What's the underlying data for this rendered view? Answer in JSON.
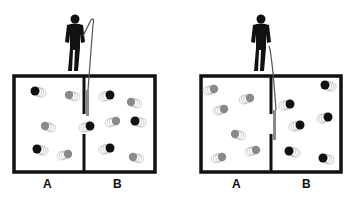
{
  "colors": {
    "fast_molecule": "#111111",
    "slow_molecule": "#8a8a8a",
    "wall": "#111111",
    "gate": "#8a8a8a"
  },
  "panels": [
    {
      "name": "before",
      "box": {
        "x": 14,
        "y": 76,
        "w": 141,
        "h": 96
      },
      "divider_x": 84,
      "gate_state": "raised",
      "figure_x": 75,
      "labels": {
        "left": "A",
        "right": "B"
      },
      "label_positions": {
        "left": 48,
        "right": 118
      },
      "molecules": [
        {
          "x": 35,
          "y": 91,
          "type": "fast"
        },
        {
          "x": 69,
          "y": 95,
          "type": "slow"
        },
        {
          "x": 110,
          "y": 95,
          "type": "fast"
        },
        {
          "x": 131,
          "y": 102,
          "type": "slow"
        },
        {
          "x": 45,
          "y": 126,
          "type": "slow"
        },
        {
          "x": 90,
          "y": 126,
          "type": "fast"
        },
        {
          "x": 116,
          "y": 121,
          "type": "slow"
        },
        {
          "x": 135,
          "y": 121,
          "type": "fast"
        },
        {
          "x": 37,
          "y": 149,
          "type": "fast"
        },
        {
          "x": 68,
          "y": 154,
          "type": "slow"
        },
        {
          "x": 110,
          "y": 148,
          "type": "fast"
        },
        {
          "x": 133,
          "y": 157,
          "type": "slow"
        }
      ]
    },
    {
      "name": "after",
      "box": {
        "x": 201,
        "y": 76,
        "w": 140,
        "h": 96
      },
      "divider_x": 271,
      "gate_state": "lowered",
      "figure_x": 261,
      "labels": {
        "left": "A",
        "right": "B"
      },
      "label_positions": {
        "left": 237,
        "right": 307
      },
      "molecules": [
        {
          "x": 214,
          "y": 89,
          "type": "slow"
        },
        {
          "x": 250,
          "y": 98,
          "type": "slow"
        },
        {
          "x": 224,
          "y": 109,
          "type": "slow"
        },
        {
          "x": 235,
          "y": 134,
          "type": "slow"
        },
        {
          "x": 222,
          "y": 157,
          "type": "slow"
        },
        {
          "x": 256,
          "y": 150,
          "type": "slow"
        },
        {
          "x": 325,
          "y": 85,
          "type": "fast"
        },
        {
          "x": 290,
          "y": 104,
          "type": "fast"
        },
        {
          "x": 328,
          "y": 117,
          "type": "fast"
        },
        {
          "x": 300,
          "y": 125,
          "type": "fast"
        },
        {
          "x": 289,
          "y": 151,
          "type": "fast"
        },
        {
          "x": 323,
          "y": 158,
          "type": "fast"
        }
      ]
    }
  ]
}
